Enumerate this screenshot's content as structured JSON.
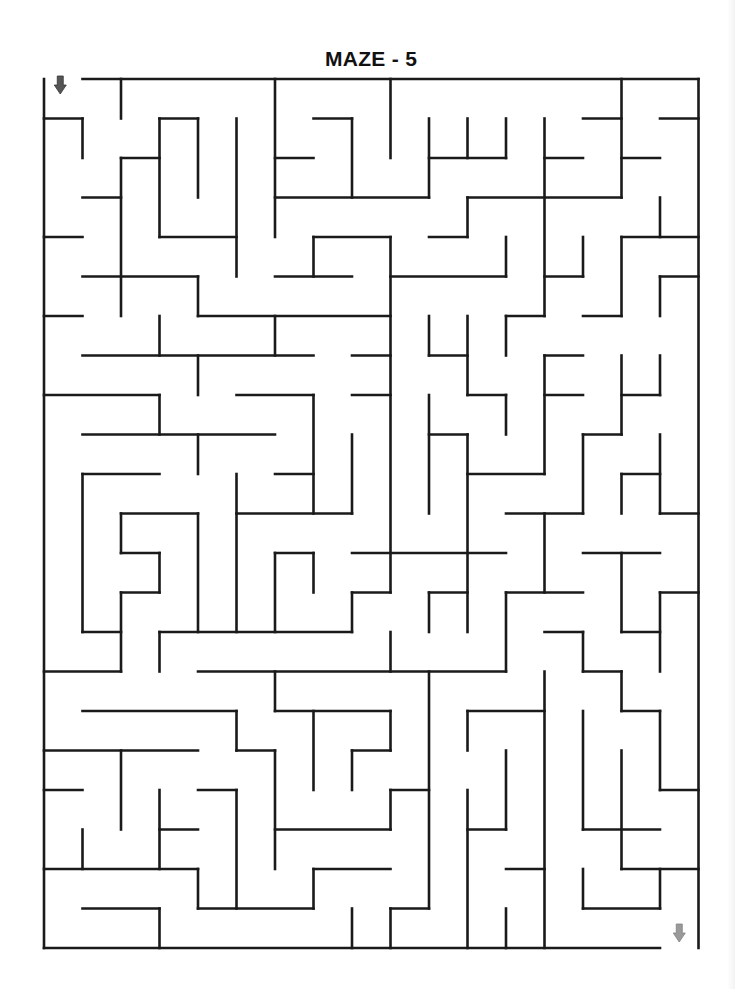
{
  "title": "MAZE - 5",
  "maze": {
    "cols": 17,
    "rows": 22,
    "origin": [
      44,
      79
    ],
    "cell_w": 38.5,
    "cell_h": 39.5,
    "wall_color": "#1a1a1a",
    "wall_width": 2.6,
    "entrance": {
      "label": "start",
      "icon": "arrow-down-icon",
      "col": 0,
      "color": "#555555"
    },
    "exit": {
      "label": "finish",
      "icon": "arrow-down-icon",
      "col": 16,
      "color": "#9a9a9a"
    },
    "border": {
      "h": [
        [
          0,
          1,
          17
        ],
        [
          22,
          0,
          16
        ]
      ],
      "v": [
        [
          0,
          0,
          22
        ],
        [
          17,
          0,
          22
        ]
      ]
    },
    "h_walls": [
      [
        1,
        0,
        1
      ],
      [
        1,
        3,
        4
      ],
      [
        1,
        7,
        8
      ],
      [
        1,
        14,
        15
      ],
      [
        1,
        16,
        17
      ],
      [
        2,
        2,
        3
      ],
      [
        2,
        6,
        7
      ],
      [
        2,
        10,
        12
      ],
      [
        2,
        13,
        14
      ],
      [
        2,
        15,
        16
      ],
      [
        3,
        1,
        2
      ],
      [
        3,
        6,
        10
      ],
      [
        3,
        11,
        15
      ],
      [
        4,
        0,
        1
      ],
      [
        4,
        3,
        5
      ],
      [
        4,
        7,
        9
      ],
      [
        4,
        10,
        11
      ],
      [
        4,
        15,
        17
      ],
      [
        5,
        1,
        4
      ],
      [
        5,
        6,
        8
      ],
      [
        5,
        9,
        12
      ],
      [
        5,
        13,
        14
      ],
      [
        5,
        16,
        17
      ],
      [
        6,
        0,
        1
      ],
      [
        6,
        4,
        9
      ],
      [
        6,
        12,
        13
      ],
      [
        6,
        14,
        15
      ],
      [
        7,
        1,
        7
      ],
      [
        7,
        8,
        9
      ],
      [
        7,
        10,
        11
      ],
      [
        7,
        13,
        14
      ],
      [
        8,
        0,
        3
      ],
      [
        8,
        5,
        7
      ],
      [
        8,
        8,
        9
      ],
      [
        8,
        11,
        12
      ],
      [
        8,
        13,
        14
      ],
      [
        8,
        15,
        16
      ],
      [
        9,
        1,
        6
      ],
      [
        9,
        10,
        11
      ],
      [
        9,
        14,
        15
      ],
      [
        10,
        1,
        3
      ],
      [
        10,
        6,
        7
      ],
      [
        10,
        11,
        13
      ],
      [
        10,
        15,
        16
      ],
      [
        11,
        2,
        4
      ],
      [
        11,
        5,
        8
      ],
      [
        11,
        12,
        14
      ],
      [
        11,
        16,
        17
      ],
      [
        12,
        2,
        3
      ],
      [
        12,
        6,
        7
      ],
      [
        12,
        8,
        12
      ],
      [
        12,
        14,
        16
      ],
      [
        13,
        2,
        3
      ],
      [
        13,
        8,
        9
      ],
      [
        13,
        10,
        11
      ],
      [
        13,
        12,
        14
      ],
      [
        13,
        16,
        17
      ],
      [
        14,
        1,
        2
      ],
      [
        14,
        3,
        8
      ],
      [
        14,
        13,
        14
      ],
      [
        14,
        15,
        16
      ],
      [
        15,
        0,
        2
      ],
      [
        15,
        4,
        12
      ],
      [
        15,
        14,
        15
      ],
      [
        16,
        1,
        5
      ],
      [
        16,
        6,
        9
      ],
      [
        16,
        11,
        13
      ],
      [
        16,
        15,
        16
      ],
      [
        17,
        0,
        4
      ],
      [
        17,
        5,
        6
      ],
      [
        17,
        8,
        9
      ],
      [
        18,
        0,
        1
      ],
      [
        18,
        4,
        5
      ],
      [
        18,
        9,
        10
      ],
      [
        18,
        16,
        17
      ],
      [
        19,
        3,
        4
      ],
      [
        19,
        6,
        9
      ],
      [
        19,
        11,
        12
      ],
      [
        19,
        14,
        16
      ],
      [
        20,
        0,
        4
      ],
      [
        20,
        7,
        9
      ],
      [
        20,
        12,
        13
      ],
      [
        20,
        15,
        17
      ],
      [
        21,
        1,
        3
      ],
      [
        21,
        4,
        7
      ],
      [
        21,
        9,
        10
      ],
      [
        21,
        14,
        16
      ]
    ],
    "v_walls": [
      [
        1,
        1,
        2
      ],
      [
        1,
        10,
        14
      ],
      [
        1,
        19,
        20
      ],
      [
        2,
        0,
        1
      ],
      [
        2,
        2,
        6
      ],
      [
        2,
        11,
        12
      ],
      [
        2,
        13,
        15
      ],
      [
        2,
        17,
        19
      ],
      [
        3,
        1,
        4
      ],
      [
        3,
        6,
        7
      ],
      [
        3,
        8,
        9
      ],
      [
        3,
        12,
        13
      ],
      [
        3,
        14,
        15
      ],
      [
        3,
        18,
        20
      ],
      [
        3,
        21,
        22
      ],
      [
        4,
        1,
        3
      ],
      [
        4,
        5,
        6
      ],
      [
        4,
        7,
        8
      ],
      [
        4,
        9,
        10
      ],
      [
        4,
        11,
        14
      ],
      [
        4,
        20,
        21
      ],
      [
        5,
        1,
        5
      ],
      [
        5,
        10,
        14
      ],
      [
        5,
        16,
        17
      ],
      [
        5,
        18,
        21
      ],
      [
        6,
        0,
        4
      ],
      [
        6,
        6,
        7
      ],
      [
        6,
        12,
        14
      ],
      [
        6,
        15,
        16
      ],
      [
        6,
        17,
        20
      ],
      [
        7,
        4,
        5
      ],
      [
        7,
        8,
        11
      ],
      [
        7,
        12,
        13
      ],
      [
        7,
        16,
        18
      ],
      [
        7,
        20,
        21
      ],
      [
        8,
        1,
        3
      ],
      [
        8,
        9,
        11
      ],
      [
        8,
        13,
        14
      ],
      [
        8,
        17,
        18
      ],
      [
        8,
        21,
        22
      ],
      [
        9,
        0,
        2
      ],
      [
        9,
        4,
        13
      ],
      [
        9,
        14,
        15
      ],
      [
        9,
        16,
        17
      ],
      [
        9,
        18,
        19
      ],
      [
        9,
        21,
        22
      ],
      [
        10,
        1,
        3
      ],
      [
        10,
        6,
        7
      ],
      [
        10,
        8,
        11
      ],
      [
        10,
        13,
        14
      ],
      [
        10,
        15,
        21
      ],
      [
        11,
        1,
        2
      ],
      [
        11,
        3,
        4
      ],
      [
        11,
        6,
        8
      ],
      [
        11,
        9,
        14
      ],
      [
        11,
        16,
        17
      ],
      [
        11,
        18,
        22
      ],
      [
        12,
        1,
        2
      ],
      [
        12,
        4,
        5
      ],
      [
        12,
        6,
        7
      ],
      [
        12,
        8,
        9
      ],
      [
        12,
        13,
        15
      ],
      [
        12,
        17,
        19
      ],
      [
        12,
        21,
        22
      ],
      [
        13,
        1,
        6
      ],
      [
        13,
        7,
        10
      ],
      [
        13,
        11,
        13
      ],
      [
        13,
        15,
        22
      ],
      [
        14,
        4,
        5
      ],
      [
        14,
        9,
        11
      ],
      [
        14,
        14,
        15
      ],
      [
        14,
        16,
        19
      ],
      [
        14,
        20,
        21
      ],
      [
        15,
        0,
        3
      ],
      [
        15,
        4,
        6
      ],
      [
        15,
        7,
        9
      ],
      [
        15,
        10,
        11
      ],
      [
        15,
        12,
        14
      ],
      [
        15,
        15,
        16
      ],
      [
        15,
        17,
        20
      ],
      [
        16,
        3,
        4
      ],
      [
        16,
        5,
        6
      ],
      [
        16,
        7,
        8
      ],
      [
        16,
        9,
        11
      ],
      [
        16,
        13,
        15
      ],
      [
        16,
        16,
        18
      ],
      [
        16,
        20,
        21
      ]
    ]
  }
}
